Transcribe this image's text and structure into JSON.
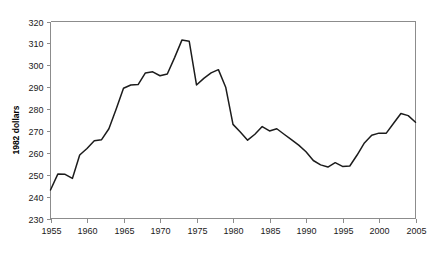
{
  "chart_data": {
    "type": "line",
    "title": "",
    "xlabel": "",
    "ylabel": "1982 dollars",
    "xlim": [
      1955,
      2005
    ],
    "ylim": [
      230,
      320
    ],
    "grid": false,
    "legend": "none",
    "x_ticks": [
      1955,
      1960,
      1965,
      1970,
      1975,
      1980,
      1985,
      1990,
      1995,
      2000,
      2005
    ],
    "y_ticks": [
      230,
      240,
      250,
      260,
      270,
      280,
      290,
      300,
      310,
      320
    ],
    "x_tick_labels": [
      "1955",
      "1960",
      "1965",
      "1970",
      "1975",
      "1980",
      "1985",
      "1990",
      "1995",
      "2000",
      "2005"
    ],
    "y_tick_labels": [
      "230",
      "240",
      "250",
      "260",
      "270",
      "280",
      "290",
      "300",
      "310",
      "320"
    ],
    "series": [
      {
        "name": "1982 dollars",
        "color": "#1c1c1c",
        "x": [
          1955,
          1956,
          1957,
          1958,
          1959,
          1960,
          1961,
          1962,
          1963,
          1964,
          1965,
          1966,
          1967,
          1968,
          1969,
          1970,
          1971,
          1972,
          1973,
          1974,
          1975,
          1976,
          1977,
          1978,
          1979,
          1980,
          1981,
          1982,
          1983,
          1984,
          1985,
          1986,
          1987,
          1988,
          1989,
          1990,
          1991,
          1992,
          1993,
          1994,
          1995,
          1996,
          1997,
          1998,
          1999,
          2000,
          2001,
          2002,
          2003,
          2004,
          2005
        ],
        "values": [
          243.0,
          250.3,
          250.2,
          248.3,
          259.0,
          262.0,
          265.5,
          266.0,
          271.0,
          280.0,
          289.5,
          291.0,
          291.2,
          296.5,
          297.0,
          295.2,
          296.0,
          303.5,
          311.5,
          311.0,
          291.0,
          294.0,
          296.5,
          298.0,
          290.0,
          273.0,
          269.5,
          265.8,
          268.5,
          272.0,
          270.0,
          271.0,
          268.5,
          266.0,
          263.5,
          260.5,
          256.5,
          254.5,
          253.5,
          255.5,
          253.8,
          254.0,
          259.0,
          264.5,
          268.0,
          269.0,
          269.0,
          273.5,
          278.0,
          277.0,
          274.0
        ]
      }
    ]
  },
  "axis": {
    "y_title": "1982 dollars"
  }
}
